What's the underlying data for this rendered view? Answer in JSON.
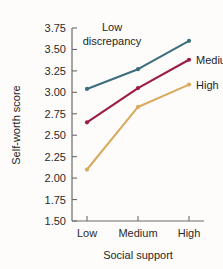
{
  "chart_data": {
    "type": "line",
    "title": "",
    "xlabel": "Social support",
    "ylabel": "Self-worth score",
    "categories": [
      "Low",
      "Medium",
      "High"
    ],
    "ylim": [
      1.5,
      3.75
    ],
    "yticks": [
      "1.50",
      "1.75",
      "2.00",
      "2.25",
      "2.50",
      "2.75",
      "3.00",
      "3.25",
      "3.50",
      "3.75"
    ],
    "ytick_values": [
      1.5,
      1.75,
      2.0,
      2.25,
      2.5,
      2.75,
      3.0,
      3.25,
      3.5,
      3.75
    ],
    "grid": false,
    "legend_position": "inline-right",
    "series": [
      {
        "name": "Low discrepancy",
        "label": "Low discrepancy",
        "label_line1": "Low",
        "label_line2": "discrepancy",
        "color": "#3d6e7e",
        "values": [
          3.04,
          3.27,
          3.6
        ]
      },
      {
        "name": "Medium",
        "label": "Medium",
        "color": "#9b1c46",
        "values": [
          2.65,
          3.05,
          3.38
        ]
      },
      {
        "name": "High",
        "label": "High",
        "color": "#d8ab60",
        "values": [
          2.1,
          2.83,
          3.09
        ]
      }
    ]
  }
}
